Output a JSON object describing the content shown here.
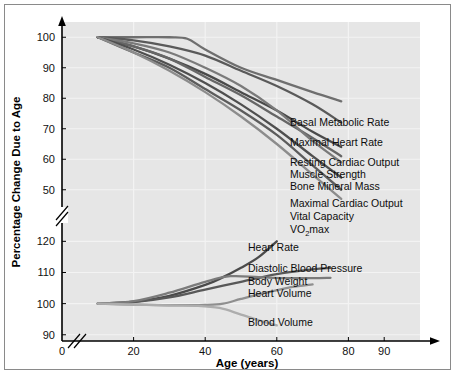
{
  "chart_data": {
    "type": "line",
    "title": "",
    "xlabel": "Age (years)",
    "ylabel": "Percentage Change Due to Age",
    "xlim": [
      0,
      100
    ],
    "xticks": [
      0,
      20,
      40,
      60,
      80,
      90
    ],
    "xticklabels": [
      "0",
      "20",
      "40",
      "60",
      "80",
      "90"
    ],
    "axis_break_x": true,
    "axis_break_y": true,
    "grid": true,
    "legend_position": "right-inline-end-of-line",
    "panels": [
      {
        "name": "upper-panel",
        "ylim": [
          45,
          105
        ],
        "yticks": [
          50,
          60,
          70,
          80,
          90,
          100
        ],
        "yticklabels": [
          "50",
          "60",
          "70",
          "80",
          "90",
          "100"
        ],
        "series": [
          {
            "name": "Basal Metabolic Rate",
            "color": "#6f6f6f",
            "points": [
              [
                10,
                100
              ],
              [
                20,
                100
              ],
              [
                30,
                100
              ],
              [
                35,
                99.5
              ],
              [
                40,
                96
              ],
              [
                50,
                90
              ],
              [
                60,
                86
              ],
              [
                70,
                82
              ],
              [
                78,
                79
              ]
            ]
          },
          {
            "name": "Maximal Heart Rate",
            "color": "#5a5a5a",
            "points": [
              [
                10,
                100
              ],
              [
                20,
                99
              ],
              [
                30,
                97
              ],
              [
                40,
                94
              ],
              [
                50,
                89
              ],
              [
                60,
                84
              ],
              [
                70,
                78
              ],
              [
                78,
                72
              ]
            ]
          },
          {
            "name": "Resting Cardiac Output",
            "color": "#4a4a4a",
            "points": [
              [
                10,
                100
              ],
              [
                20,
                97
              ],
              [
                30,
                93
              ],
              [
                40,
                88
              ],
              [
                50,
                82
              ],
              [
                60,
                76
              ],
              [
                70,
                69
              ],
              [
                78,
                64
              ]
            ]
          },
          {
            "name": "Muscle Strength",
            "color": "#666666",
            "points": [
              [
                10,
                100
              ],
              [
                20,
                97
              ],
              [
                30,
                93
              ],
              [
                40,
                87
              ],
              [
                50,
                81
              ],
              [
                60,
                74
              ],
              [
                70,
                67
              ],
              [
                78,
                61
              ]
            ]
          },
          {
            "name": "Bone Mineral Mass",
            "color": "#7a7a7a",
            "points": [
              [
                10,
                100
              ],
              [
                20,
                98
              ],
              [
                30,
                95
              ],
              [
                40,
                90
              ],
              [
                50,
                84
              ],
              [
                60,
                76
              ],
              [
                70,
                66
              ],
              [
                78,
                59
              ]
            ]
          },
          {
            "name": "Maximal Cardiac Output",
            "color": "#4f4f4f",
            "points": [
              [
                10,
                100
              ],
              [
                20,
                96
              ],
              [
                30,
                91
              ],
              [
                40,
                85
              ],
              [
                50,
                78
              ],
              [
                60,
                70
              ],
              [
                70,
                61
              ],
              [
                78,
                54
              ]
            ]
          },
          {
            "name": "Vital Capacity",
            "color": "#5c5c5c",
            "points": [
              [
                10,
                100
              ],
              [
                20,
                95
              ],
              [
                30,
                90
              ],
              [
                40,
                83
              ],
              [
                50,
                76
              ],
              [
                60,
                68
              ],
              [
                70,
                58
              ],
              [
                78,
                50
              ]
            ]
          },
          {
            "name": "VO2max",
            "color": "#8c8c8c",
            "label_main": "VO",
            "label_sub": "2",
            "label_tail": "max",
            "points": [
              [
                10,
                100
              ],
              [
                20,
                95
              ],
              [
                30,
                89
              ],
              [
                40,
                82
              ],
              [
                50,
                74
              ],
              [
                60,
                65
              ],
              [
                70,
                55
              ],
              [
                78,
                47
              ]
            ]
          }
        ]
      },
      {
        "name": "lower-panel",
        "ylim": [
          88,
          123
        ],
        "yticks": [
          90,
          100,
          110,
          120
        ],
        "yticklabels": [
          "90",
          "100",
          "110",
          "120"
        ],
        "series": [
          {
            "name": "Heart Rate",
            "color": "#4a4a4a",
            "points": [
              [
                10,
                100
              ],
              [
                20,
                100.6
              ],
              [
                30,
                102.5
              ],
              [
                40,
                106
              ],
              [
                45,
                108.5
              ],
              [
                50,
                111.5
              ],
              [
                55,
                115
              ],
              [
                60,
                120
              ]
            ]
          },
          {
            "name": "Diastolic Blood Pressure",
            "color": "#585858",
            "points": [
              [
                10,
                100
              ],
              [
                20,
                100.5
              ],
              [
                30,
                102
              ],
              [
                40,
                104.5
              ],
              [
                50,
                107
              ],
              [
                60,
                109.5
              ],
              [
                70,
                111
              ],
              [
                75,
                111.5
              ]
            ]
          },
          {
            "name": "Body Weight",
            "color": "#7b7b7b",
            "points": [
              [
                10,
                100
              ],
              [
                20,
                100.8
              ],
              [
                30,
                103.5
              ],
              [
                40,
                107
              ],
              [
                47,
                108.8
              ],
              [
                55,
                108.5
              ],
              [
                62,
                108.2
              ],
              [
                70,
                108.2
              ],
              [
                75,
                108.3
              ]
            ]
          },
          {
            "name": "Heart Volume",
            "color": "#8f8f8f",
            "points": [
              [
                10,
                100
              ],
              [
                20,
                99.7
              ],
              [
                30,
                99.5
              ],
              [
                40,
                99.6
              ],
              [
                45,
                100
              ],
              [
                50,
                101.5
              ],
              [
                57,
                103.5
              ],
              [
                64,
                105.3
              ],
              [
                70,
                106.2
              ]
            ]
          },
          {
            "name": "Blood Volume",
            "color": "#adadad",
            "points": [
              [
                10,
                100
              ],
              [
                20,
                99.7
              ],
              [
                30,
                99.4
              ],
              [
                38,
                99.3
              ],
              [
                44,
                98.6
              ],
              [
                50,
                96.5
              ],
              [
                56,
                94.3
              ],
              [
                60,
                93
              ]
            ]
          }
        ]
      }
    ]
  },
  "figure": {
    "y_axis_title": "Percentage Change Due to Age",
    "x_axis_title": "Age (years)",
    "x_tick_labels": [
      "0",
      "20",
      "40",
      "60",
      "80",
      "90"
    ],
    "y_tick_labels_upper": [
      "100",
      "90",
      "80",
      "70",
      "60",
      "50"
    ],
    "y_tick_labels_lower": [
      "120",
      "110",
      "100",
      "90"
    ],
    "labels_upper": [
      "Basal Metabolic Rate",
      "Maximal Heart Rate",
      "Resting Cardiac Output",
      "Muscle Strength",
      "Bone Mineral Mass",
      "Maximal Cardiac Output",
      "Vital Capacity"
    ],
    "label_vo2_main": "VO",
    "label_vo2_sub": "2",
    "label_vo2_tail": "max",
    "labels_lower": [
      "Heart Rate",
      "Diastolic Blood Pressure",
      "Body Weight",
      "Heart Volume",
      "Blood Volume"
    ],
    "colors": {
      "plot_background": "#e6e6e6",
      "gridline": "#f3f3f3",
      "axis": "#000000",
      "frame_border": "#8a8a8a",
      "page_background": "#ffffff"
    }
  }
}
